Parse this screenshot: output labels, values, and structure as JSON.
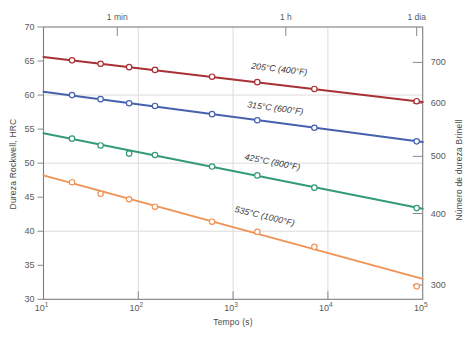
{
  "figure": {
    "background": "#ffffff",
    "frame_color": "#7d7d7d",
    "grid_color": "#dcdcdc",
    "tick_color": "#8a8a8a",
    "tick_label_color": "#5a5a5a",
    "series_label_color": "#3d3d3d",
    "plot_box": {
      "left": 43.5,
      "top": 27,
      "width": 379.2,
      "height": 272.3
    }
  },
  "axis_titles": {
    "left": "Dureza Rockwell, HRC",
    "right": "Número de dureza Brinell",
    "bottom": "Tempo (s)"
  },
  "chart_data": {
    "type": "line",
    "title": "",
    "xlabel": "Tempo (s)",
    "ylabel_left": "Dureza Rockwell, HRC",
    "ylabel_right": "Número de dureza Brinell",
    "x_scale": "log",
    "xlim": [
      10,
      100000
    ],
    "x_log_range": [
      1,
      5
    ],
    "ylim": [
      30,
      70
    ],
    "grid": true,
    "x_tick_exponents": [
      1,
      2,
      3,
      4,
      5
    ],
    "x_tick_base": "10",
    "x_grid_exponents": [
      2,
      3,
      4
    ],
    "y_left_ticks": [
      30,
      35,
      40,
      45,
      50,
      55,
      60,
      65,
      70
    ],
    "y_grid_hrc": [
      40,
      50,
      60
    ],
    "y_right_ticks": [
      {
        "label": "700",
        "hrc": 64.8
      },
      {
        "label": "600",
        "hrc": 58.8
      },
      {
        "label": "500",
        "hrc": 51.0
      },
      {
        "label": "400",
        "hrc": 42.6
      },
      {
        "label": "300",
        "hrc": 32.1
      }
    ],
    "top_ticks": [
      {
        "label": "1 min",
        "t": 60
      },
      {
        "label": "1 h",
        "t": 3600
      },
      {
        "label": "1 dia",
        "t": 86400
      }
    ],
    "series": [
      {
        "name": "205°C (400°F)",
        "color": "#a93034",
        "line": [
          [
            10,
            65.6
          ],
          [
            100000,
            59.0
          ]
        ],
        "points": [
          [
            20,
            65.1
          ],
          [
            40,
            64.6
          ],
          [
            80,
            64.1
          ],
          [
            150,
            63.7
          ],
          [
            600,
            62.7
          ],
          [
            1800,
            61.9
          ],
          [
            7200,
            60.9
          ],
          [
            86400,
            59.1
          ]
        ],
        "label": {
          "x": 279,
          "y": 72,
          "angle": 6.6
        }
      },
      {
        "name": "315°C (600°F)",
        "color": "#4661ae",
        "line": [
          [
            10,
            60.5
          ],
          [
            100000,
            53.1
          ]
        ],
        "points": [
          [
            20,
            60.0
          ],
          [
            40,
            59.4
          ],
          [
            80,
            58.8
          ],
          [
            150,
            58.4
          ],
          [
            600,
            57.2
          ],
          [
            1800,
            56.3
          ],
          [
            7200,
            55.2
          ],
          [
            86400,
            53.2
          ]
        ],
        "label": {
          "x": 275,
          "y": 111,
          "angle": 7.4
        }
      },
      {
        "name": "425°C (800°F)",
        "color": "#33997b",
        "line": [
          [
            10,
            54.4
          ],
          [
            100000,
            43.3
          ]
        ],
        "points": [
          [
            20,
            53.6
          ],
          [
            40,
            52.6
          ],
          [
            80,
            51.4
          ],
          [
            150,
            51.2
          ],
          [
            600,
            49.5
          ],
          [
            1800,
            48.2
          ],
          [
            7200,
            46.4
          ],
          [
            86400,
            43.4
          ]
        ],
        "label": {
          "x": 272,
          "y": 165,
          "angle": 11
        }
      },
      {
        "name": "535°C (1000°F)",
        "color": "#f09355",
        "line": [
          [
            10,
            48.2
          ],
          [
            100000,
            33.0
          ]
        ],
        "points": [
          [
            20,
            47.2
          ],
          [
            40,
            45.5
          ],
          [
            80,
            44.7
          ],
          [
            150,
            43.6
          ],
          [
            600,
            41.4
          ],
          [
            1800,
            39.9
          ],
          [
            7200,
            37.7
          ],
          [
            86400,
            31.9
          ]
        ],
        "label": {
          "x": 264,
          "y": 219,
          "angle": 13.5
        }
      }
    ]
  }
}
